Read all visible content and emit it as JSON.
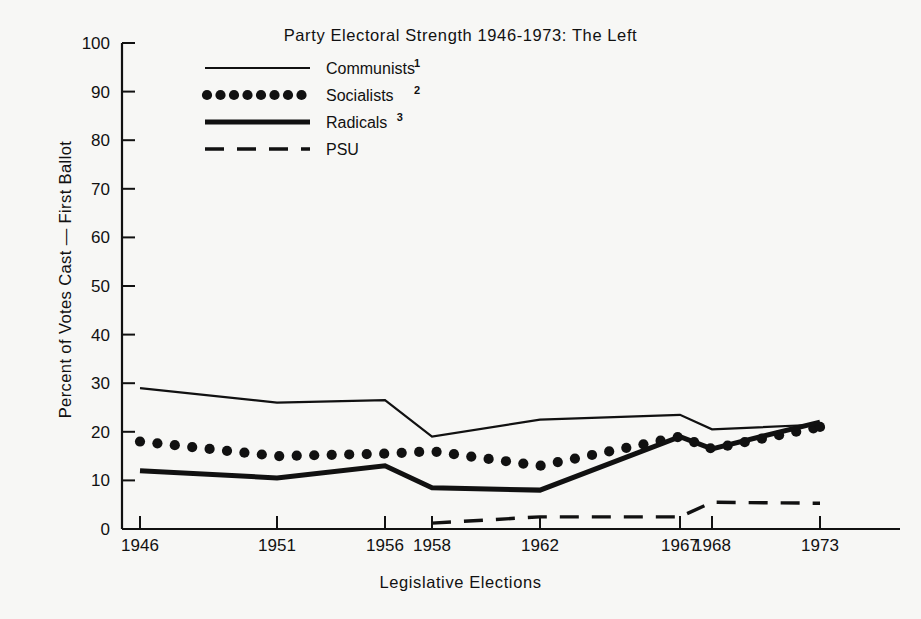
{
  "chart_data": {
    "type": "line",
    "title": "Party Electoral Strength 1946-1973: The Left",
    "xlabel": "Legislative  Elections",
    "ylabel": "Percent of Votes Cast — First Ballot",
    "categories": [
      "1946",
      "1951",
      "1956",
      "1958",
      "1962",
      "1967",
      "1968",
      "1973"
    ],
    "x_tick_labels": [
      "1946",
      "1951",
      "1956",
      "1958",
      "1962",
      "1967",
      "1968",
      "1973"
    ],
    "y_tick_labels": [
      "0",
      "10",
      "20",
      "30",
      "40",
      "50",
      "60",
      "70",
      "80",
      "90",
      "100"
    ],
    "ylim": [
      0,
      100
    ],
    "y_major_step": 10,
    "grid": false,
    "legend_position": "upper-left-inside",
    "series": [
      {
        "name": "Communists",
        "footnote": "1",
        "style": "thin-solid",
        "values": [
          29,
          26,
          26.5,
          19,
          22.5,
          23.5,
          20.5,
          21.5
        ]
      },
      {
        "name": "Socialists",
        "footnote": "2",
        "style": "dotted",
        "values": [
          18,
          15,
          15.5,
          16,
          13,
          19,
          16.5,
          21
        ]
      },
      {
        "name": "Radicals",
        "footnote": "3",
        "style": "thick-solid",
        "values": [
          12,
          10.5,
          13,
          8.5,
          8,
          19,
          16.5,
          22
        ]
      },
      {
        "name": "PSU",
        "footnote": "",
        "style": "dashed",
        "values": [
          null,
          null,
          null,
          1.2,
          2.5,
          2.5,
          5.5,
          5.3
        ]
      }
    ]
  },
  "legend": {
    "items": [
      {
        "label": "Communists",
        "sup": "1",
        "swatch": "thin-solid"
      },
      {
        "label": "Socialists",
        "sup": "2",
        "swatch": "dotted"
      },
      {
        "label": "Radicals",
        "sup": "3",
        "swatch": "thick-solid"
      },
      {
        "label": "PSU",
        "sup": "",
        "swatch": "dashed"
      }
    ]
  },
  "colors": {
    "ink": "#111111",
    "paper": "#f7f7f5"
  }
}
